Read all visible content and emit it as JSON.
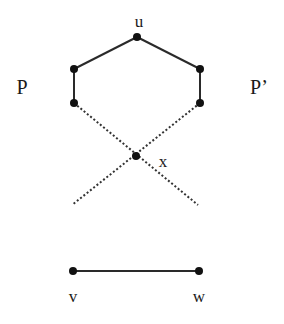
{
  "diagram": {
    "type": "graph",
    "labels": {
      "u": "u",
      "x": "x",
      "v": "v",
      "w": "w",
      "P": "P",
      "P_prime": "P’"
    },
    "nodes": [
      {
        "id": "u",
        "x": 137,
        "y": 37
      },
      {
        "id": "pl1",
        "x": 74,
        "y": 69
      },
      {
        "id": "pl2",
        "x": 74,
        "y": 103
      },
      {
        "id": "pr1",
        "x": 200,
        "y": 69
      },
      {
        "id": "pr2",
        "x": 200,
        "y": 103
      },
      {
        "id": "x",
        "x": 136,
        "y": 156
      },
      {
        "id": "v",
        "x": 73,
        "y": 271
      },
      {
        "id": "w",
        "x": 199,
        "y": 271
      }
    ],
    "edges": [
      {
        "from": "u",
        "to": "pl1",
        "style": "solid"
      },
      {
        "from": "pl1",
        "to": "pl2",
        "style": "solid"
      },
      {
        "from": "u",
        "to": "pr1",
        "style": "solid"
      },
      {
        "from": "pr1",
        "to": "pr2",
        "style": "solid"
      },
      {
        "from": "pl2",
        "to": "x",
        "style": "dotted"
      },
      {
        "from": "pr2",
        "to": "x",
        "style": "dotted"
      },
      {
        "from": "x",
        "to": "end-left",
        "style": "dotted"
      },
      {
        "from": "x",
        "to": "end-right",
        "style": "dotted"
      },
      {
        "from": "v",
        "to": "w",
        "style": "solid"
      }
    ],
    "colors": {
      "background": "#ffffff",
      "ink": "#1a1a1a"
    }
  }
}
